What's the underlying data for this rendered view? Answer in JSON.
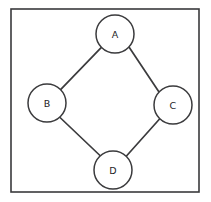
{
  "diagram": {
    "type": "undirected-graph",
    "title": "",
    "canvas": {
      "width": 211,
      "height": 202,
      "background": "#ffffff"
    },
    "frame": {
      "x": 11,
      "y": 9,
      "width": 188,
      "height": 183,
      "stroke_color": "#3a3a3c",
      "fill_color": "#ffffff"
    },
    "style": {
      "node_fill": "#ffffff",
      "node_stroke": "#3b3b3d",
      "edge_stroke": "#3b3b3d",
      "label_color": "#1d1d1f"
    },
    "nodes": [
      {
        "id": "A",
        "label": "A",
        "cx": 115,
        "cy": 34,
        "r": 19
      },
      {
        "id": "B",
        "label": "B",
        "cx": 47,
        "cy": 103,
        "r": 19
      },
      {
        "id": "C",
        "label": "C",
        "cx": 173,
        "cy": 105,
        "r": 19
      },
      {
        "id": "D",
        "label": "D",
        "cx": 113,
        "cy": 170,
        "r": 19
      }
    ],
    "edges": [
      {
        "id": "A-B",
        "from": "A",
        "to": "B",
        "x1": 101.4,
        "y1": 47.3,
        "x2": 60.6,
        "y2": 89.7
      },
      {
        "id": "A-C",
        "from": "A",
        "to": "C",
        "x1": 129.0,
        "y1": 47.0,
        "x2": 159.0,
        "y2": 92.0
      },
      {
        "id": "B-D",
        "from": "B",
        "to": "D",
        "x1": 59.5,
        "y1": 117.0,
        "x2": 100.5,
        "y2": 156.0
      },
      {
        "id": "C-D",
        "from": "C",
        "to": "D",
        "x1": 160.0,
        "y1": 118.5,
        "x2": 126.0,
        "y2": 156.5
      }
    ]
  }
}
